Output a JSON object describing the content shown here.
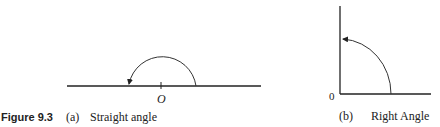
{
  "figure": {
    "number_label": "Figure 9.3",
    "panel_a": {
      "tag": "(a)",
      "caption": "Straight angle",
      "origin_label": "O"
    },
    "panel_b": {
      "tag": "(b)",
      "caption": "Right Angle",
      "origin_label": "0"
    }
  },
  "colors": {
    "line": "#222222",
    "background": "#ffffff"
  }
}
